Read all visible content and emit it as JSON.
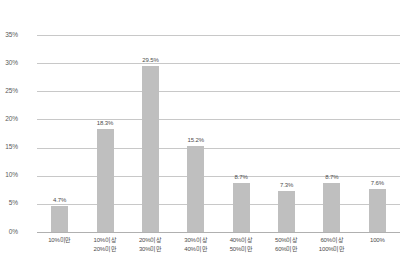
{
  "chart_data": {
    "type": "bar",
    "title": "",
    "xlabel": "",
    "ylabel": "",
    "ylim": [
      0,
      35
    ],
    "grid": true,
    "legend": false,
    "bar_color": "#bfbfbf",
    "gridline_color": "#c8c8c8",
    "categories": [
      "10%미만",
      "10%이상 20%미만",
      "20%이상 30%미만",
      "30%이상 40%미만",
      "40%이상 50%미만",
      "50%이상 60%미만",
      "60%이상 100%미만",
      "100%"
    ],
    "category_lines": [
      [
        "10%미만",
        ""
      ],
      [
        "10%이상",
        "20%미만"
      ],
      [
        "20%이상",
        "30%미만"
      ],
      [
        "30%이상",
        "40%미만"
      ],
      [
        "40%이상",
        "50%미만"
      ],
      [
        "50%이상",
        "60%미만"
      ],
      [
        "60%이상",
        "100%미만"
      ],
      [
        "100%",
        ""
      ]
    ],
    "values": [
      4.7,
      18.3,
      29.5,
      15.2,
      8.7,
      7.3,
      8.7,
      7.6
    ],
    "value_labels": [
      "4.7%",
      "18.3%",
      "29.5%",
      "15.2%",
      "8.7%",
      "7.3%",
      "8.7%",
      "7.6%"
    ],
    "y_ticks": [
      0,
      5,
      10,
      15,
      20,
      25,
      30,
      35
    ],
    "y_tick_labels": [
      "0%",
      "5%",
      "10%",
      "15%",
      "20%",
      "25%",
      "30%",
      "35%"
    ]
  }
}
